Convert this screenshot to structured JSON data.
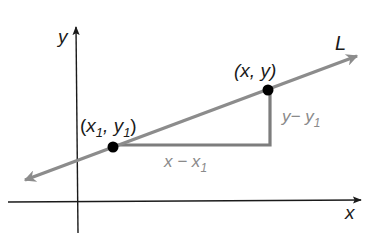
{
  "diagram": {
    "axes": {
      "x_label": "x",
      "y_label": "y"
    },
    "line": {
      "label": "L",
      "color": "#8c8c8c"
    },
    "points": [
      {
        "id": "p1",
        "label_open": "(",
        "label_x": "x",
        "label_x_sub": "1",
        "label_sep": ", ",
        "label_y": "y",
        "label_y_sub": "1",
        "label_close": ")"
      },
      {
        "id": "p2",
        "label": "(x, y)"
      }
    ],
    "triangle": {
      "horizontal_leg_label": "x − x",
      "horizontal_leg_sub": "1",
      "vertical_leg_label": "y− y",
      "vertical_leg_sub": "1",
      "color": "#7d7d7d"
    },
    "colors": {
      "axis": "#1a1a1a",
      "point": "#000000",
      "label_dark": "#1a1a1a",
      "label_gray": "#8a8a8a"
    }
  }
}
